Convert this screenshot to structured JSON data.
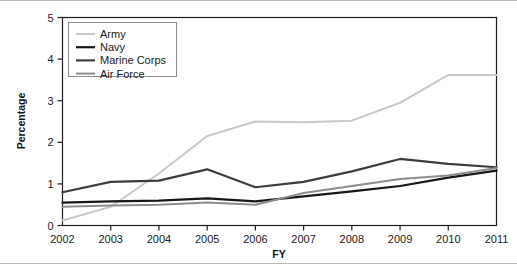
{
  "chart_data": {
    "type": "line",
    "title": "",
    "xlabel": "FY",
    "ylabel": "Percentage",
    "x": [
      2002,
      2003,
      2004,
      2005,
      2006,
      2007,
      2008,
      2009,
      2010,
      2011
    ],
    "categories": [
      "2002",
      "2003",
      "2004",
      "2005",
      "2006",
      "2007",
      "2008",
      "2009",
      "2010",
      "2011"
    ],
    "xlim": [
      2002,
      2011
    ],
    "ylim": [
      0,
      5
    ],
    "yticks": [
      0,
      1,
      2,
      3,
      4,
      5
    ],
    "ytick_labels": [
      "0",
      "1",
      "2",
      "3",
      "4",
      "5"
    ],
    "grid": false,
    "legend_position": "upper-left",
    "series": [
      {
        "name": "Army",
        "color": "#c9c9c9",
        "width": 2.0,
        "values": [
          0.12,
          0.45,
          1.25,
          2.15,
          2.5,
          2.48,
          2.52,
          2.95,
          3.62,
          3.62
        ]
      },
      {
        "name": "Navy",
        "color": "#171717",
        "width": 2.2,
        "values": [
          0.55,
          0.58,
          0.6,
          0.65,
          0.58,
          0.7,
          0.82,
          0.95,
          1.15,
          1.32
        ]
      },
      {
        "name": "Marine Corps",
        "color": "#3c3c3c",
        "width": 2.2,
        "values": [
          0.8,
          1.05,
          1.08,
          1.35,
          0.92,
          1.05,
          1.3,
          1.6,
          1.48,
          1.4
        ]
      },
      {
        "name": "Air Force",
        "color": "#8d8d8d",
        "width": 2.0,
        "values": [
          0.45,
          0.48,
          0.5,
          0.55,
          0.5,
          0.78,
          0.95,
          1.12,
          1.2,
          1.38
        ]
      }
    ]
  },
  "axes": {
    "y_title": "Percentage",
    "x_title": "FY"
  },
  "legend": {
    "entries": [
      {
        "label": "Army"
      },
      {
        "label": "Navy"
      },
      {
        "label": "Marine Corps"
      },
      {
        "label": "Air Force"
      }
    ]
  }
}
